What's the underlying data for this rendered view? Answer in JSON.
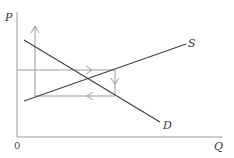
{
  "diagram": {
    "type": "supply-demand-cobweb",
    "axes": {
      "y_label": "P",
      "x_label": "Q",
      "origin_label": "0"
    },
    "curves": [
      {
        "name": "S",
        "label": "S",
        "kind": "supply"
      },
      {
        "name": "D",
        "label": "D",
        "kind": "demand"
      }
    ],
    "arrows": [
      {
        "direction": "up",
        "description": "vertical price adjustment line"
      },
      {
        "direction": "right",
        "description": "upper horizontal quantity path"
      },
      {
        "direction": "down",
        "description": "vertical adjustment on right"
      },
      {
        "direction": "left",
        "description": "lower horizontal quantity path"
      }
    ],
    "colors": {
      "axis": "#9a9a9a",
      "curve": "#444444",
      "arrow_path": "#9a9a9a"
    }
  }
}
